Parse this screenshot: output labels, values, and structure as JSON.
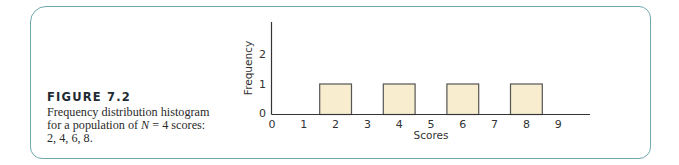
{
  "caption": {
    "title": "FIGURE 7.2",
    "line1": "Frequency distribution histogram",
    "line2_pre": "for a population of ",
    "line2_var": "N",
    "line2_post": " = 4 scores:",
    "line3": "2, 4, 6, 8."
  },
  "colors": {
    "frame": "#6FA9AC",
    "bar_fill": "#F8EDCF",
    "bar_stroke": "#555555",
    "axis": "#333333"
  },
  "chart_data": {
    "type": "bar",
    "title": "Frequency distribution histogram for a population of N = 4 scores: 2, 4, 6, 8.",
    "xlabel": "Scores",
    "ylabel": "Frequency",
    "x_ticks": [
      "0",
      "1",
      "2",
      "3",
      "4",
      "5",
      "6",
      "7",
      "8",
      "9"
    ],
    "y_ticks": [
      "0",
      "1",
      "2"
    ],
    "categories": [
      2,
      4,
      6,
      8
    ],
    "values": [
      1,
      1,
      1,
      1
    ],
    "xlim": [
      0,
      9.9
    ],
    "ylim": [
      0,
      3
    ],
    "grid": false,
    "legend": null
  }
}
